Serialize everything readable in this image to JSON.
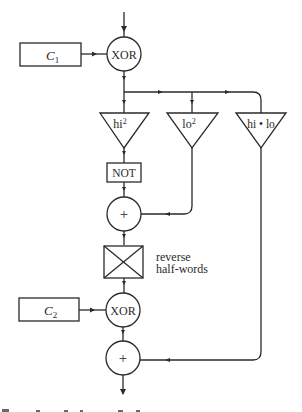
{
  "diagram": {
    "type": "flowchart",
    "nodes": {
      "c1": {
        "label": "C",
        "sub": "1"
      },
      "xor1": {
        "label": "XOR"
      },
      "hi2": {
        "label": "hi",
        "sup": "2"
      },
      "lo2": {
        "label": "lo",
        "sup": "2"
      },
      "hilo": {
        "label": "hi • lo"
      },
      "not": {
        "label": "NOT"
      },
      "add1": {
        "label": "+"
      },
      "reverse": {
        "label_line1": "reverse",
        "label_line2": "half-words"
      },
      "c2": {
        "label": "C",
        "sub": "2"
      },
      "xor2": {
        "label": "XOR"
      },
      "add2": {
        "label": "+"
      }
    },
    "edges": [
      [
        "input",
        "xor1"
      ],
      [
        "c1",
        "xor1"
      ],
      [
        "xor1",
        "hi2"
      ],
      [
        "xor1",
        "lo2"
      ],
      [
        "xor1",
        "hilo"
      ],
      [
        "hi2",
        "not"
      ],
      [
        "not",
        "add1"
      ],
      [
        "lo2",
        "add1"
      ],
      [
        "add1",
        "reverse"
      ],
      [
        "reverse",
        "xor2"
      ],
      [
        "c2",
        "xor2"
      ],
      [
        "xor2",
        "add2"
      ],
      [
        "hilo",
        "add2"
      ],
      [
        "add2",
        "output"
      ]
    ],
    "colors": {
      "line": "#2a2a2a",
      "background": "#ffffff"
    }
  }
}
